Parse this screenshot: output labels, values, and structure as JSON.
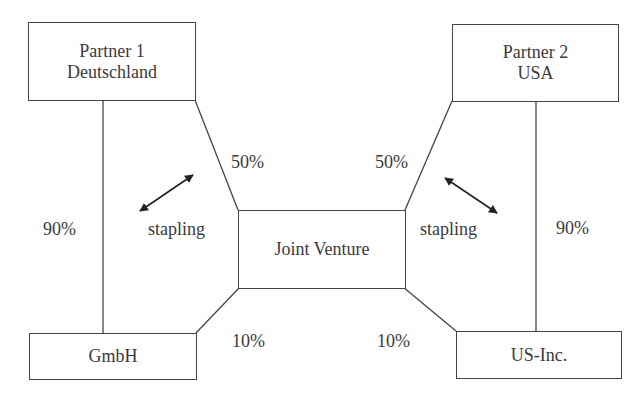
{
  "diagram": {
    "type": "ownership-structure",
    "nodes": {
      "partner1": {
        "line1": "Partner 1",
        "line2": "Deutschland"
      },
      "partner2": {
        "line1": "Partner 2",
        "line2": "USA"
      },
      "joint_venture": {
        "label": "Joint Venture"
      },
      "gmbh": {
        "label": "GmbH"
      },
      "us_inc": {
        "label": "US-Inc."
      }
    },
    "edges": [
      {
        "from": "partner1",
        "to": "gmbh",
        "label": "90%"
      },
      {
        "from": "partner1",
        "to": "joint_venture",
        "label": "50%"
      },
      {
        "from": "partner2",
        "to": "joint_venture",
        "label": "50%"
      },
      {
        "from": "partner2",
        "to": "us_inc",
        "label": "90%"
      },
      {
        "from": "gmbh",
        "to": "joint_venture",
        "label": "10%"
      },
      {
        "from": "us_inc",
        "to": "joint_venture",
        "label": "10%"
      }
    ],
    "labels": {
      "p1_gmbh_pct": "90%",
      "p1_jv_pct": "50%",
      "p2_jv_pct": "50%",
      "p2_usinc_pct": "90%",
      "gmbh_jv_pct": "10%",
      "usinc_jv_pct": "10%",
      "stapling_left": "stapling",
      "stapling_right": "stapling"
    },
    "colors": {
      "line": "#444444",
      "text": "#3a3a3a",
      "background": "#ffffff"
    }
  }
}
